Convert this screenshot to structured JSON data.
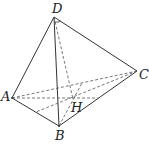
{
  "figure": {
    "type": "tetrahedron",
    "labels": {
      "D": "D",
      "A": "A",
      "B": "B",
      "C": "C",
      "H": "H"
    },
    "points": {
      "D": [
        54,
        17
      ],
      "A": [
        12,
        98
      ],
      "B": [
        59,
        126
      ],
      "C": [
        137,
        71
      ],
      "H": [
        73,
        99
      ]
    },
    "solid_edges": [
      [
        "D",
        "A"
      ],
      [
        "D",
        "B"
      ],
      [
        "D",
        "C"
      ],
      [
        "A",
        "B"
      ],
      [
        "B",
        "C"
      ]
    ],
    "dashed_edges": [
      [
        "A",
        "C"
      ],
      [
        "D",
        "H"
      ],
      [
        "A",
        "M_BC"
      ],
      [
        "C",
        "M_AB"
      ],
      [
        "B",
        "N_AC"
      ]
    ],
    "right_angle_at": "D"
  }
}
